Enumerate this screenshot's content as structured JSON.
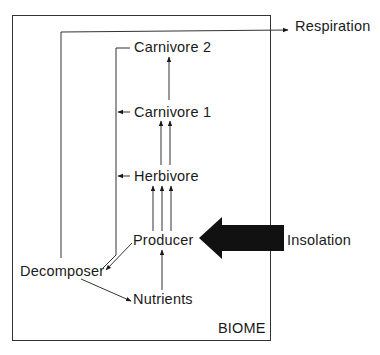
{
  "diagram": {
    "boundary_label": "BIOME",
    "nodes": {
      "carnivore2": "Carnivore 2",
      "carnivore1": "Carnivore 1",
      "herbivore": "Herbivore",
      "producer": "Producer",
      "decomposer": "Decomposer",
      "nutrients": "Nutrients"
    },
    "external": {
      "respiration": "Respiration",
      "insolation": "Insolation"
    },
    "edges": [
      {
        "from": "insolation",
        "to": "producer",
        "style": "bold-arrow"
      },
      {
        "from": "producer",
        "to": "herbivore",
        "count": 3
      },
      {
        "from": "herbivore",
        "to": "carnivore1",
        "count": 2
      },
      {
        "from": "carnivore1",
        "to": "carnivore2",
        "count": 1
      },
      {
        "from": "nutrients",
        "to": "producer"
      },
      {
        "from": "producer",
        "to": "decomposer"
      },
      {
        "from": "decomposer",
        "to": "nutrients"
      },
      {
        "from": "trophic-levels",
        "to": "decomposer",
        "style": "return-line"
      },
      {
        "from": "decomposer",
        "to": "respiration",
        "style": "exit-line"
      }
    ]
  }
}
